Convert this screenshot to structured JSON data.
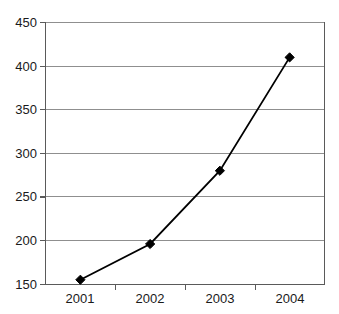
{
  "chart_data": {
    "type": "line",
    "title": "",
    "subtitle": "",
    "xlabel": "",
    "ylabel": "",
    "categories": [
      "2001",
      "2002",
      "2003",
      "2004"
    ],
    "values": [
      155,
      196,
      280,
      410
    ],
    "series": [
      {
        "name": "",
        "values": [
          155,
          196,
          280,
          410
        ]
      }
    ],
    "ylim": [
      150,
      450
    ],
    "ytick_values": [
      150,
      200,
      250,
      300,
      350,
      400,
      450
    ],
    "ytick_labels": [
      "150",
      "200",
      "250",
      "300",
      "350",
      "400",
      "450"
    ],
    "xtick_labels": [
      "2001",
      "2002",
      "2003",
      "2004"
    ],
    "grid": "horizontal",
    "legend": "none",
    "marker": "diamond",
    "line_color": "#000000",
    "marker_color": "#000000",
    "grid_color": "#8f8f8f",
    "axis_color": "#5a5a5a",
    "background": "#ffffff",
    "annotations": []
  }
}
